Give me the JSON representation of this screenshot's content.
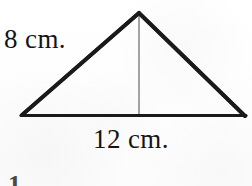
{
  "figure": {
    "kind": "geometry-diagram",
    "shape": "isosceles-triangle-with-altitude",
    "background_color": "#fefefe",
    "outline_color": "#1a1a1a",
    "altitude_color": "#8d8d8d",
    "text_color": "#141414",
    "labels": {
      "side_label": "8 cm.",
      "base_label": "12 cm."
    },
    "partial_text_bottom": "1",
    "geometry": {
      "apex": {
        "x": 139,
        "y": 13
      },
      "left_vertex": {
        "x": 22,
        "y": 115
      },
      "right_vertex": {
        "x": 245,
        "y": 116
      },
      "altitude_foot": {
        "x": 139,
        "y": 115
      },
      "outline_stroke_width": 4,
      "base_stroke_width": 3,
      "altitude_stroke_width": 1.6
    }
  }
}
